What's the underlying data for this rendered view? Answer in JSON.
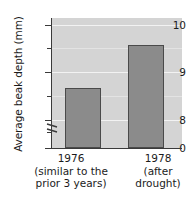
{
  "chart_data": {
    "type": "bar",
    "title": "",
    "subtitle": "",
    "xlabel": "",
    "ylabel": "Average beak depth (mm)",
    "categories": [
      "1976",
      "1978"
    ],
    "category_sublabels": [
      [
        "(similar to the",
        "prior 3 years)"
      ],
      [
        "(after",
        "drought)"
      ]
    ],
    "values": [
      8.87,
      9.77
    ],
    "value_unit": "mm",
    "ylim": [
      7.6,
      10.35
    ],
    "y_axis_break": true,
    "y_axis_break_between": [
      0,
      7.6
    ],
    "yticks_major": [
      0,
      8,
      9,
      10
    ],
    "yticklabels": [
      "0",
      "8",
      "9",
      "10"
    ],
    "yticks_minor": [
      7.75,
      8.5,
      9.5
    ],
    "grid": "horizontal",
    "gridlines_at": [
      8,
      8.5,
      9,
      9.5,
      10
    ],
    "legend": "none",
    "series": [
      {
        "name": "Average beak depth",
        "values": [
          8.87,
          9.77
        ]
      }
    ],
    "colors": {
      "bar_fill": "#8b8b8b",
      "bar_edge": "#4a4a4a",
      "plot_background": "#d4d4d4",
      "gridline": "#f2f2f2",
      "axis": "#3a3a3a",
      "text": "#1b1b1b",
      "page_background": "#ffffff"
    }
  }
}
